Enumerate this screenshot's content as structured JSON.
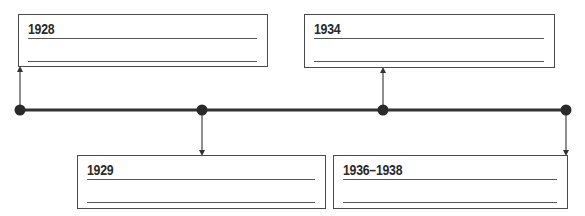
{
  "diagram": {
    "type": "timeline",
    "events": [
      {
        "label": "1928",
        "position": "above",
        "blank_lines": 2
      },
      {
        "label": "1929",
        "position": "below",
        "blank_lines": 2
      },
      {
        "label": "1934",
        "position": "above",
        "blank_lines": 2
      },
      {
        "label": "1936–1938",
        "position": "below",
        "blank_lines": 2
      }
    ],
    "colors": {
      "line": "#333333",
      "box_border": "#4a4a4a",
      "text": "#2a2a2a"
    }
  }
}
